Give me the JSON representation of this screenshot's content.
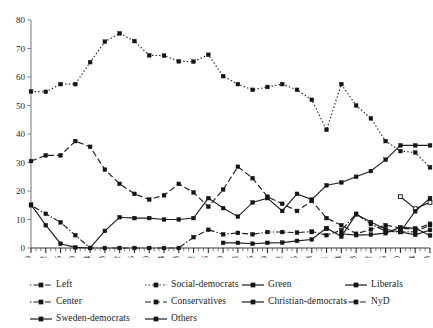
{
  "chart_data": {
    "type": "line",
    "title": "",
    "subtitle": "",
    "xlabel": "",
    "ylabel": "",
    "xlim_labels": [
      "1919",
      "2018"
    ],
    "ylim": [
      0,
      80
    ],
    "yticks": [
      0,
      10,
      20,
      30,
      40,
      50,
      60,
      70,
      80
    ],
    "grid": false,
    "legend_position": "bottom",
    "categories": [
      "1919",
      "1922",
      "1926",
      "1930",
      "1934",
      "1938",
      "1942",
      "1946",
      "1950",
      "1954",
      "1958",
      "1962",
      "1966",
      "1970",
      "1973",
      "1976",
      "1979",
      "1982",
      "1985",
      "1988",
      "1991",
      "1994",
      "1998",
      "2002",
      "2006",
      "2010",
      "2014",
      "2018"
    ],
    "series": [
      {
        "name": "Left",
        "marker": "filled-square",
        "dash": "dot-dash",
        "values": [
          15.0,
          12.0,
          9.0,
          4.5,
          0.0,
          0.0,
          0.0,
          0.0,
          0.0,
          0.0,
          0.0,
          3.8,
          6.4,
          4.8,
          5.3,
          4.8,
          5.6,
          5.6,
          5.4,
          5.8,
          4.5,
          6.2,
          12.0,
          8.4,
          5.9,
          5.6,
          5.7,
          8.0
        ]
      },
      {
        "name": "Social-democrats",
        "marker": "filled-square",
        "dash": "dotted",
        "values": [
          54.9,
          54.8,
          57.5,
          57.5,
          65.2,
          72.4,
          75.3,
          72.6,
          67.6,
          67.5,
          65.5,
          65.4,
          67.8,
          60.3,
          57.5,
          55.5,
          56.5,
          57.5,
          55.5,
          52.0,
          41.5,
          57.5,
          50.0,
          45.5,
          37.5,
          34.0,
          33.5,
          28.3
        ]
      },
      {
        "name": "Green",
        "marker": "filled-square",
        "dash": "solid",
        "values": [
          0.0,
          0.0,
          0.0,
          0.0,
          0.0,
          0.0,
          0.0,
          0.0,
          0.0,
          0.0,
          0.0,
          0.0,
          0.0,
          0.0,
          0.0,
          0.0,
          0.0,
          0.0,
          0.0,
          5.6,
          0.0,
          5.0,
          4.5,
          4.7,
          5.2,
          7.3,
          6.9,
          4.4
        ]
      },
      {
        "name": "Liberals",
        "marker": "open-square",
        "dash": "solid",
        "values": [
          0.0,
          0.0,
          0.0,
          0.0,
          0.0,
          0.0,
          0.0,
          0.0,
          0.0,
          0.0,
          0.0,
          0.0,
          0.0,
          0.0,
          0.0,
          0.0,
          0.0,
          0.0,
          0.0,
          0.0,
          0.0,
          0.0,
          0.0,
          0.0,
          0.0,
          18.0,
          13.8,
          16.0
        ]
      },
      {
        "name": "Center",
        "marker": "filled-square",
        "dash": "dashed",
        "values": [
          30.5,
          32.5,
          32.5,
          37.5,
          35.5,
          27.5,
          22.5,
          19.0,
          17.0,
          18.5,
          22.5,
          19.5,
          14.5,
          20.5,
          28.5,
          24.5,
          18.0,
          15.5,
          13.0,
          16.5,
          10.5,
          8.0,
          5.0,
          6.5,
          8.0,
          7.0,
          6.5,
          8.5
        ]
      },
      {
        "name": "Conservatives",
        "marker": "filled-square",
        "dash": "dashed",
        "values": [
          0.0,
          0.0,
          0.0,
          0.0,
          0.0,
          0.0,
          0.0,
          0.0,
          0.0,
          0.0,
          0.0,
          0.0,
          0.0,
          0.0,
          0.0,
          0.0,
          0.0,
          0.0,
          0.0,
          0.0,
          0.0,
          0.0,
          0.0,
          0.0,
          0.0,
          0.0,
          0.0,
          0.0
        ]
      },
      {
        "name": "Christian-democrats",
        "marker": "filled-square",
        "dash": "solid",
        "values": [
          0.0,
          0.0,
          0.0,
          0.0,
          0.0,
          0.0,
          0.0,
          0.0,
          0.0,
          0.0,
          0.0,
          0.0,
          0.0,
          1.8,
          1.8,
          1.5,
          1.8,
          1.9,
          2.5,
          3.0,
          7.0,
          4.0,
          11.8,
          9.1,
          6.6,
          5.6,
          4.6,
          6.3
        ]
      },
      {
        "name": "NyD",
        "marker": "filled-square",
        "dash": "dot-dash",
        "values": [
          0.0,
          0.0,
          0.0,
          0.0,
          0.0,
          0.0,
          0.0,
          0.0,
          0.0,
          0.0,
          0.0,
          0.0,
          0.0,
          0.0,
          0.0,
          0.0,
          0.0,
          0.0,
          0.0,
          0.0,
          6.7,
          0.0,
          0.0,
          0.0,
          0.0,
          0.0,
          0.0,
          0.0
        ]
      },
      {
        "name": "Sweden-democrats",
        "marker": "filled-square",
        "dash": "solid",
        "values": [
          0.0,
          0.0,
          0.0,
          0.0,
          0.0,
          0.0,
          0.0,
          0.0,
          0.0,
          0.0,
          0.0,
          0.0,
          0.0,
          0.0,
          0.0,
          0.0,
          0.0,
          0.0,
          0.0,
          0.0,
          0.0,
          0.0,
          0.0,
          0.0,
          0.0,
          5.7,
          12.9,
          17.5
        ]
      },
      {
        "name": "Others",
        "marker": "filled-square",
        "dash": "solid",
        "values": [
          15.2,
          8.0,
          1.5,
          0.2,
          0.0,
          6.0,
          10.8,
          10.5,
          10.5,
          10.0,
          10.0,
          10.5,
          17.5,
          14.0,
          11.0,
          16.0,
          17.5,
          13.0,
          19.0,
          17.0,
          22.0,
          23.0,
          25.0,
          27.0,
          31.0,
          36.0,
          36.0,
          36.0
        ]
      }
    ],
    "legend": [
      {
        "name": "Left",
        "style": "dot-dash",
        "marker": "filled-square"
      },
      {
        "name": "Social-democrats",
        "style": "dotted",
        "marker": "filled-square"
      },
      {
        "name": "Green",
        "style": "solid",
        "marker": "filled-square"
      },
      {
        "name": "Liberals",
        "style": "solid",
        "marker": "filled-square"
      },
      {
        "name": "Center",
        "style": "dot-dash",
        "marker": "filled-square"
      },
      {
        "name": "Conservatives",
        "style": "dashed",
        "marker": "filled-square"
      },
      {
        "name": "Christian-democrats",
        "style": "solid",
        "marker": "filled-square"
      },
      {
        "name": "NyD",
        "style": "dot-dash",
        "marker": "filled-square"
      },
      {
        "name": "Sweden-democrats",
        "style": "solid",
        "marker": "filled-square"
      },
      {
        "name": "Others",
        "style": "solid",
        "marker": "filled-square"
      }
    ]
  },
  "axis": {
    "y_tick_labels": [
      "80",
      "70",
      "60",
      "50",
      "40",
      "30",
      "20",
      "10",
      "0"
    ],
    "x_tick_labels": [
      "1919",
      "1922",
      "1926",
      "1930",
      "1934",
      "1938",
      "1942",
      "1946",
      "1950",
      "1954",
      "1958",
      "1962",
      "1966",
      "1970",
      "1973",
      "1976",
      "1979",
      "1982",
      "1985",
      "1988",
      "1991",
      "1994",
      "1998",
      "2002",
      "2006",
      "2010",
      "2014",
      "2018"
    ]
  }
}
